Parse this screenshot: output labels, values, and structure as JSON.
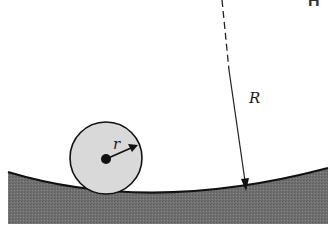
{
  "diagram": {
    "labels": {
      "small_radius": "r",
      "large_radius": "R",
      "partial_top_text": "H"
    },
    "colors": {
      "ground_fill": "#6e6e6e",
      "ball_fill": "#d9d9d9",
      "outline": "#111111",
      "background": "#ffffff"
    }
  }
}
